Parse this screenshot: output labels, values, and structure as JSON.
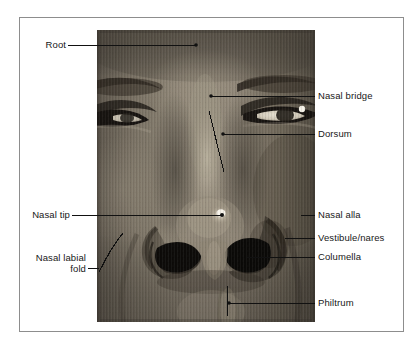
{
  "figure": {
    "type": "anatomical-photo-diagram",
    "photo": {
      "alt_name": "face-nose-closeup-grayscale-photo",
      "x": 97,
      "y": 30,
      "width": 218,
      "height": 292
    },
    "frame_color": "#8d8d8d",
    "text_color": "#171717",
    "leader_color": "#111111",
    "background": "#ffffff"
  },
  "labels": {
    "root": "Root",
    "nasal_bridge": "Nasal bridge",
    "dorsum": "Dorsum",
    "nasal_tip": "Nasal tip",
    "nasal_alla": "Nasal alla",
    "vestibule_nares": "Vestibule/nares",
    "columella": "Columella",
    "nasal_labial_fold": "Nasal labial\nfold",
    "philtrum": "Philtrum"
  },
  "annotation_list": [
    {
      "id": "root",
      "text": "Root",
      "side": "left",
      "label_x": 38,
      "label_y": 39,
      "leader": "horizontal",
      "tip_x": 196,
      "tip_y": 45
    },
    {
      "id": "nasal-bridge",
      "text": "Nasal bridge",
      "side": "right",
      "label_x": 318,
      "label_y": 90,
      "leader": "horizontal",
      "tip_x": 211,
      "tip_y": 96
    },
    {
      "id": "dorsum",
      "text": "Dorsum",
      "side": "right",
      "label_x": 318,
      "label_y": 128,
      "leader": "horizontal",
      "tip_x": 223,
      "tip_y": 134
    },
    {
      "id": "nasal-tip",
      "text": "Nasal tip",
      "side": "left",
      "label_x": 40,
      "label_y": 209,
      "leader": "horizontal",
      "tip_x": 222,
      "tip_y": 215
    },
    {
      "id": "nasal-alla",
      "text": "Nasal alla",
      "side": "right",
      "label_x": 318,
      "label_y": 209,
      "leader": "horizontal",
      "tip_x": 301,
      "tip_y": 215
    },
    {
      "id": "vestibule-nares",
      "text": "Vestibule/nares",
      "side": "right",
      "label_x": 318,
      "label_y": 232,
      "leader": "horizontal",
      "tip_x": 285,
      "tip_y": 238
    },
    {
      "id": "columella",
      "text": "Columella",
      "side": "right",
      "label_x": 318,
      "label_y": 251,
      "leader": "horizontal",
      "tip_x": 247,
      "tip_y": 257
    },
    {
      "id": "nasal-labial-fold",
      "text": "Nasal labial fold",
      "side": "left",
      "label_x": 22,
      "label_y": 252,
      "leader": "curve",
      "tip_x": 99,
      "tip_y": 268
    },
    {
      "id": "philtrum",
      "text": "Philtrum",
      "side": "right",
      "label_x": 318,
      "label_y": 297,
      "leader": "horizontal",
      "tip_x": 229,
      "tip_y": 303
    }
  ]
}
